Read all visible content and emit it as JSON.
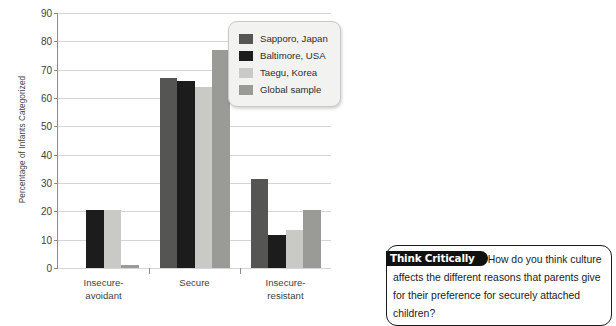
{
  "chart_data": {
    "type": "bar",
    "title": "",
    "xlabel": "",
    "ylabel": "Percentage of Infants Categorized",
    "ylim": [
      0,
      90
    ],
    "ytick_step": 10,
    "yticks": [
      0,
      10,
      20,
      30,
      40,
      50,
      60,
      70,
      80,
      90
    ],
    "grid": true,
    "legend_position": "top-right",
    "categories": [
      "Insecure-avoidant",
      "Secure",
      "Insecure-resistant"
    ],
    "category_lines": [
      [
        "Insecure-",
        "avoidant"
      ],
      [
        "Secure"
      ],
      [
        "Insecure-",
        "resistant"
      ]
    ],
    "series": [
      {
        "name": "Sapporo, Japan",
        "color": "#555553",
        "values": [
          0,
          67,
          31.5
        ]
      },
      {
        "name": "Baltimore, USA",
        "color": "#1c1c1c",
        "values": [
          20.5,
          66,
          11.5
        ]
      },
      {
        "name": "Taegu, Korea",
        "color": "#c9c9c5",
        "values": [
          20.5,
          64,
          13.5
        ]
      },
      {
        "name": "Global sample",
        "color": "#9a9a97",
        "values": [
          1,
          77,
          20.5
        ]
      }
    ]
  },
  "legend": {
    "items": [
      {
        "label": "Sapporo, Japan"
      },
      {
        "label": "Baltimore, USA"
      },
      {
        "label": "Taegu, Korea"
      },
      {
        "label": "Global sample"
      }
    ]
  },
  "think_critically": {
    "badge": "Think Critically",
    "text": "How do you think culture affects the different reasons that parents give for their preference for securely attached children?"
  }
}
